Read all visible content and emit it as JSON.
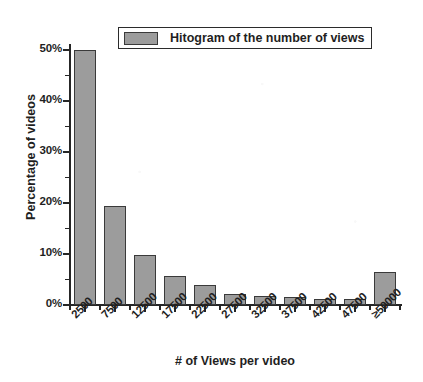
{
  "chart_data": {
    "type": "bar",
    "title": "",
    "subtitle": "",
    "xlabel": "# of Views per video",
    "ylabel": "Percentage of videos",
    "categories": [
      "2500",
      "7500",
      "12500",
      "17500",
      "22500",
      "27500",
      "32500",
      "37500",
      "42500",
      "47500",
      "≥50000"
    ],
    "values": [
      50.0,
      19.4,
      9.8,
      5.6,
      4.0,
      2.2,
      1.7,
      1.5,
      1.2,
      1.1,
      6.5
    ],
    "ylim": [
      0,
      50
    ],
    "ytick_labels": [
      "0%",
      "10%",
      "20%",
      "30%",
      "40%",
      "50%"
    ],
    "ytick_values": [
      0,
      10,
      20,
      30,
      40,
      50
    ],
    "yminor_values": [
      5,
      15,
      25,
      35,
      45
    ],
    "grid": false,
    "legend_position": "top-center",
    "legend": [
      {
        "label": "Hitogram of the number of views",
        "color": "#9c9c9c"
      }
    ],
    "series": [
      {
        "name": "Hitogram of the number of views",
        "values": [
          50.0,
          19.4,
          9.8,
          5.6,
          4.0,
          2.2,
          1.7,
          1.5,
          1.2,
          1.1,
          6.5
        ]
      }
    ],
    "bar_fill_color": "#9c9c9c",
    "bar_border_color": "#3a3a3a",
    "axis_color": "#262626"
  }
}
